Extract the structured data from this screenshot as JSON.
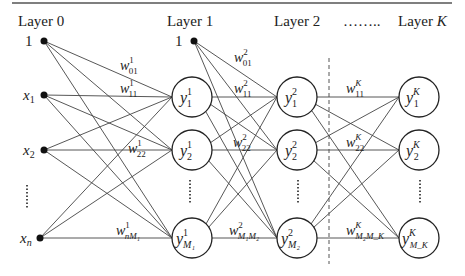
{
  "colors": {
    "stroke": "#333333",
    "text": "#222222",
    "background": "#ffffff"
  },
  "layers": [
    {
      "label": "Layer 0",
      "label_italic_part": "",
      "x": 44
    },
    {
      "label": "Layer 1",
      "label_italic_part": "",
      "x": 194
    },
    {
      "label": "Layer 2",
      "label_italic_part": "",
      "x": 297
    },
    {
      "label": "……..",
      "label_italic_part": "",
      "x": 358
    },
    {
      "label": "Layer ",
      "label_italic_part": "K",
      "x": 419
    }
  ],
  "inputs": [
    {
      "label": "1",
      "sub": "",
      "y": 41
    },
    {
      "label": "x",
      "sub": "1",
      "y": 95
    },
    {
      "label": "x",
      "sub": "2",
      "y": 150
    },
    {
      "label": "⋮",
      "sub": "",
      "y": 195
    },
    {
      "label": "x",
      "sub": "n",
      "y": 238
    }
  ],
  "bias_layer1": {
    "label": "1"
  },
  "nodes": {
    "layer1": [
      {
        "base": "y",
        "sup": "1",
        "sub": "1"
      },
      {
        "base": "y",
        "sup": "1",
        "sub": "2"
      },
      {
        "base": "y",
        "sup": "1",
        "sub": "M₁"
      }
    ],
    "layer2": [
      {
        "base": "y",
        "sup": "2",
        "sub": "1"
      },
      {
        "base": "y",
        "sup": "2",
        "sub": "2"
      },
      {
        "base": "y",
        "sup": "2",
        "sub": "M₂"
      }
    ],
    "layerK": [
      {
        "base": "y",
        "sup": "K",
        "sub": "1"
      },
      {
        "base": "y",
        "sup": "K",
        "sub": "2"
      },
      {
        "base": "y",
        "sup": "K",
        "sub": "M_K"
      }
    ]
  },
  "weights": [
    {
      "base": "w",
      "sup": "1",
      "sub": "01"
    },
    {
      "base": "w",
      "sup": "1",
      "sub": "11"
    },
    {
      "base": "w",
      "sup": "1",
      "sub": "22"
    },
    {
      "base": "w",
      "sup": "1",
      "sub": "nM₁"
    },
    {
      "base": "w",
      "sup": "2",
      "sub": "01"
    },
    {
      "base": "w",
      "sup": "2",
      "sub": "11"
    },
    {
      "base": "w",
      "sup": "2",
      "sub": "22"
    },
    {
      "base": "w",
      "sup": "2",
      "sub": "M₁M₂"
    },
    {
      "base": "w",
      "sup": "K",
      "sub": "11"
    },
    {
      "base": "w",
      "sup": "K",
      "sub": "22"
    },
    {
      "base": "w",
      "sup": "K",
      "sub": "M₂M_K"
    }
  ],
  "ellipsis_vertical": "⋮"
}
